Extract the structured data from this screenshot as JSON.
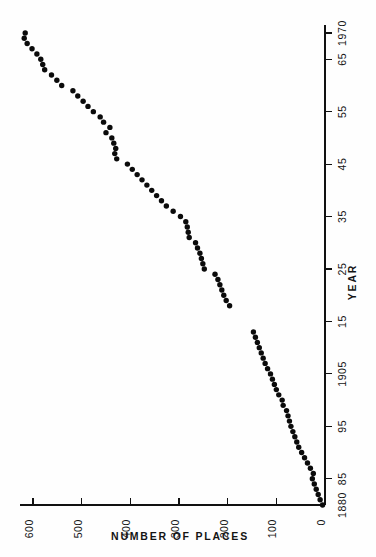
{
  "chart_data": {
    "type": "scatter",
    "title": "",
    "subtitle": "",
    "orientation": "rotated-90",
    "xlabel": "NUMBER OF PLACES",
    "ylabel": "YEAR",
    "xlim": [
      0,
      650
    ],
    "ylim": [
      1880,
      1972
    ],
    "x_axis_direction": "right-to-left",
    "y_axis_direction": "bottom-to-top",
    "grid": false,
    "legend": null,
    "annotations": [],
    "x_ticks": [
      {
        "value": 600,
        "label": "600"
      },
      {
        "value": 500,
        "label": "500"
      },
      {
        "value": 400,
        "label": "400"
      },
      {
        "value": 300,
        "label": "300"
      },
      {
        "value": 200,
        "label": "200"
      },
      {
        "value": 100,
        "label": "100"
      },
      {
        "value": 0,
        "label": "0"
      }
    ],
    "y_ticks": [
      {
        "value": 1970,
        "label": "1970"
      },
      {
        "value": 1965,
        "label": "65"
      },
      {
        "value": 1955,
        "label": "55"
      },
      {
        "value": 1945,
        "label": "45"
      },
      {
        "value": 1935,
        "label": "35"
      },
      {
        "value": 1925,
        "label": "25"
      },
      {
        "value": 1915,
        "label": "15"
      },
      {
        "value": 1905,
        "label": "1905"
      },
      {
        "value": 1895,
        "label": "95"
      },
      {
        "value": 1885,
        "label": "85"
      },
      {
        "value": 1880,
        "label": "1880"
      }
    ],
    "series": [
      {
        "name": "places",
        "marker": "filled-circle",
        "color": "#0b0b0b",
        "points": [
          {
            "year": 1880,
            "places": 5
          },
          {
            "year": 1881,
            "places": 10
          },
          {
            "year": 1882,
            "places": 14
          },
          {
            "year": 1883,
            "places": 18
          },
          {
            "year": 1884,
            "places": 22
          },
          {
            "year": 1885,
            "places": 26
          },
          {
            "year": 1886,
            "places": 24
          },
          {
            "year": 1887,
            "places": 30
          },
          {
            "year": 1888,
            "places": 36
          },
          {
            "year": 1889,
            "places": 42
          },
          {
            "year": 1890,
            "places": 48
          },
          {
            "year": 1891,
            "places": 54
          },
          {
            "year": 1892,
            "places": 58
          },
          {
            "year": 1893,
            "places": 62
          },
          {
            "year": 1894,
            "places": 66
          },
          {
            "year": 1895,
            "places": 70
          },
          {
            "year": 1896,
            "places": 73
          },
          {
            "year": 1897,
            "places": 76
          },
          {
            "year": 1898,
            "places": 79
          },
          {
            "year": 1899,
            "places": 86
          },
          {
            "year": 1900,
            "places": 88
          },
          {
            "year": 1901,
            "places": 95
          },
          {
            "year": 1902,
            "places": 100
          },
          {
            "year": 1903,
            "places": 104
          },
          {
            "year": 1904,
            "places": 108
          },
          {
            "year": 1905,
            "places": 112
          },
          {
            "year": 1906,
            "places": 118
          },
          {
            "year": 1907,
            "places": 123
          },
          {
            "year": 1908,
            "places": 127
          },
          {
            "year": 1909,
            "places": 131
          },
          {
            "year": 1910,
            "places": 135
          },
          {
            "year": 1911,
            "places": 139
          },
          {
            "year": 1912,
            "places": 143
          },
          {
            "year": 1913,
            "places": 147
          },
          {
            "year": 1918,
            "places": 196
          },
          {
            "year": 1919,
            "places": 203
          },
          {
            "year": 1920,
            "places": 208
          },
          {
            "year": 1921,
            "places": 212
          },
          {
            "year": 1922,
            "places": 216
          },
          {
            "year": 1923,
            "places": 220
          },
          {
            "year": 1924,
            "places": 226
          },
          {
            "year": 1925,
            "places": 248
          },
          {
            "year": 1926,
            "places": 251
          },
          {
            "year": 1927,
            "places": 254
          },
          {
            "year": 1928,
            "places": 257
          },
          {
            "year": 1929,
            "places": 262
          },
          {
            "year": 1930,
            "places": 266
          },
          {
            "year": 1931,
            "places": 279
          },
          {
            "year": 1932,
            "places": 281
          },
          {
            "year": 1933,
            "places": 283
          },
          {
            "year": 1934,
            "places": 286
          },
          {
            "year": 1935,
            "places": 297
          },
          {
            "year": 1936,
            "places": 312
          },
          {
            "year": 1937,
            "places": 326
          },
          {
            "year": 1938,
            "places": 336
          },
          {
            "year": 1939,
            "places": 346
          },
          {
            "year": 1940,
            "places": 356
          },
          {
            "year": 1941,
            "places": 366
          },
          {
            "year": 1942,
            "places": 376
          },
          {
            "year": 1943,
            "places": 386
          },
          {
            "year": 1944,
            "places": 396
          },
          {
            "year": 1945,
            "places": 406
          },
          {
            "year": 1946,
            "places": 428
          },
          {
            "year": 1947,
            "places": 432
          },
          {
            "year": 1948,
            "places": 430
          },
          {
            "year": 1949,
            "places": 434
          },
          {
            "year": 1950,
            "places": 438
          },
          {
            "year": 1951,
            "places": 450
          },
          {
            "year": 1952,
            "places": 442
          },
          {
            "year": 1953,
            "places": 455
          },
          {
            "year": 1954,
            "places": 462
          },
          {
            "year": 1955,
            "places": 476
          },
          {
            "year": 1956,
            "places": 487
          },
          {
            "year": 1957,
            "places": 497
          },
          {
            "year": 1958,
            "places": 508
          },
          {
            "year": 1959,
            "places": 518
          },
          {
            "year": 1960,
            "places": 541
          },
          {
            "year": 1961,
            "places": 551
          },
          {
            "year": 1962,
            "places": 562
          },
          {
            "year": 1963,
            "places": 576
          },
          {
            "year": 1964,
            "places": 580
          },
          {
            "year": 1965,
            "places": 584
          },
          {
            "year": 1966,
            "places": 592
          },
          {
            "year": 1967,
            "places": 602
          },
          {
            "year": 1968,
            "places": 612
          },
          {
            "year": 1969,
            "places": 618
          },
          {
            "year": 1970,
            "places": 616
          }
        ]
      }
    ]
  }
}
